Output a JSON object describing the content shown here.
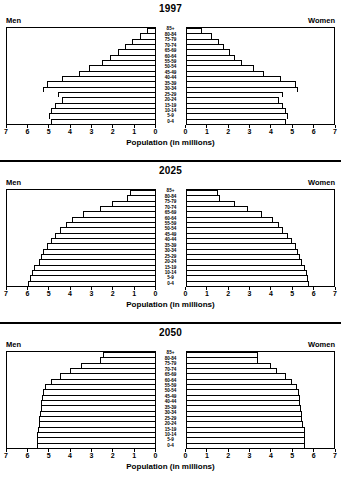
{
  "figure": {
    "x_axis_label": "Population (in millions)",
    "men_label": "Men",
    "women_label": "Women",
    "tick_labels_left": [
      "7",
      "6",
      "5",
      "4",
      "3",
      "2",
      "1",
      "0"
    ],
    "tick_labels_right": [
      "0",
      "1",
      "2",
      "3",
      "4",
      "5",
      "6",
      "7"
    ],
    "age_groups": [
      "85+",
      "80-84",
      "75-79",
      "70-74",
      "65-69",
      "60-64",
      "55-59",
      "50-54",
      "45-49",
      "40-44",
      "35-39",
      "30-34",
      "25-29",
      "20-24",
      "15-19",
      "10-14",
      "5-9",
      "0-4"
    ],
    "panels": [
      {
        "title": "1997"
      },
      {
        "title": "2025"
      },
      {
        "title": "2050"
      }
    ]
  },
  "chart_data": [
    {
      "type": "bar",
      "title": "1997",
      "subtype": "population-pyramid",
      "xlabel": "Population (in millions)",
      "ylabel": "",
      "xlim": [
        0,
        7
      ],
      "grid": false,
      "categories": [
        "85+",
        "80-84",
        "75-79",
        "70-74",
        "65-69",
        "60-64",
        "55-59",
        "50-54",
        "45-49",
        "40-44",
        "35-39",
        "30-34",
        "25-29",
        "20-24",
        "15-19",
        "10-14",
        "5-9",
        "0-4"
      ],
      "series": [
        {
          "name": "Men",
          "values": [
            0.35,
            0.7,
            1.05,
            1.4,
            1.75,
            2.1,
            2.5,
            3.1,
            3.6,
            4.4,
            5.1,
            5.3,
            4.6,
            4.4,
            4.7,
            4.9,
            5.0,
            4.9
          ]
        },
        {
          "name": "Women",
          "values": [
            0.75,
            1.2,
            1.55,
            1.8,
            2.05,
            2.3,
            2.65,
            3.2,
            3.7,
            4.5,
            5.2,
            5.3,
            4.6,
            4.4,
            4.6,
            4.7,
            4.8,
            4.7
          ]
        }
      ]
    },
    {
      "type": "bar",
      "title": "2025",
      "subtype": "population-pyramid",
      "xlabel": "Population (in millions)",
      "ylabel": "",
      "xlim": [
        0,
        7
      ],
      "grid": false,
      "categories": [
        "85+",
        "80-84",
        "75-79",
        "70-74",
        "65-69",
        "60-64",
        "55-59",
        "50-54",
        "45-49",
        "40-44",
        "35-39",
        "30-34",
        "25-29",
        "20-24",
        "15-19",
        "10-14",
        "5-9",
        "0-4"
      ],
      "series": [
        {
          "name": "Men",
          "values": [
            1.15,
            1.3,
            2.0,
            2.6,
            3.4,
            3.9,
            4.2,
            4.5,
            4.7,
            4.9,
            5.1,
            5.3,
            5.4,
            5.5,
            5.7,
            5.8,
            5.9,
            6.0
          ]
        },
        {
          "name": "Women",
          "values": [
            1.5,
            1.6,
            2.3,
            2.9,
            3.6,
            4.1,
            4.4,
            4.6,
            4.8,
            5.0,
            5.2,
            5.3,
            5.4,
            5.5,
            5.6,
            5.7,
            5.75,
            5.8
          ]
        }
      ]
    },
    {
      "type": "bar",
      "title": "2050",
      "subtype": "population-pyramid",
      "xlabel": "Population (in millions)",
      "ylabel": "",
      "xlim": [
        0,
        7
      ],
      "grid": false,
      "categories": [
        "85+",
        "80-84",
        "75-79",
        "70-74",
        "65-69",
        "60-64",
        "55-59",
        "50-54",
        "45-49",
        "40-44",
        "35-39",
        "30-34",
        "25-29",
        "20-24",
        "15-19",
        "10-14",
        "5-9",
        "0-4"
      ],
      "series": [
        {
          "name": "Men",
          "values": [
            2.45,
            2.6,
            3.5,
            4.0,
            4.5,
            4.9,
            5.2,
            5.3,
            5.35,
            5.4,
            5.4,
            5.45,
            5.5,
            5.5,
            5.55,
            5.6,
            5.6,
            5.6
          ]
        },
        {
          "name": "Women",
          "values": [
            3.4,
            3.4,
            4.0,
            4.3,
            4.7,
            5.0,
            5.25,
            5.35,
            5.4,
            5.4,
            5.45,
            5.5,
            5.5,
            5.55,
            5.6,
            5.6,
            5.6,
            5.6
          ]
        }
      ]
    }
  ]
}
